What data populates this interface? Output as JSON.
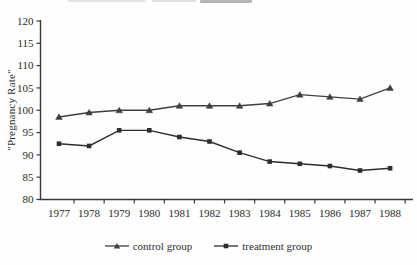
{
  "colors": {
    "axis": "#3a3a3a",
    "line_control": "#3f3f3f",
    "line_treatment": "#2d2d2d",
    "text": "#2a2a2a",
    "background": "#fefefe"
  },
  "chart_data": {
    "type": "line",
    "x": [
      "1977",
      "1978",
      "1979",
      "1980",
      "1981",
      "1982",
      "1983",
      "1984",
      "1985",
      "1986",
      "1987",
      "1988"
    ],
    "series": [
      {
        "name": "control group",
        "marker": "triangle",
        "color": "#3f3f3f",
        "values": [
          98.5,
          99.5,
          100,
          100,
          101,
          101,
          101,
          101.5,
          103.5,
          103,
          102.5,
          105
        ]
      },
      {
        "name": "treatment group",
        "marker": "square",
        "color": "#2d2d2d",
        "values": [
          92.5,
          92,
          95.5,
          95.5,
          94,
          93,
          90.5,
          88.5,
          88,
          87.5,
          86.5,
          87
        ]
      }
    ],
    "title": "",
    "xlabel": "",
    "ylabel": "\"Pregnancy Rate\"",
    "ylim": [
      80,
      120
    ],
    "ytick_step": 5,
    "yticks": [
      80,
      85,
      90,
      95,
      100,
      105,
      110,
      115,
      120
    ],
    "grid": false,
    "legend_position": "bottom"
  }
}
